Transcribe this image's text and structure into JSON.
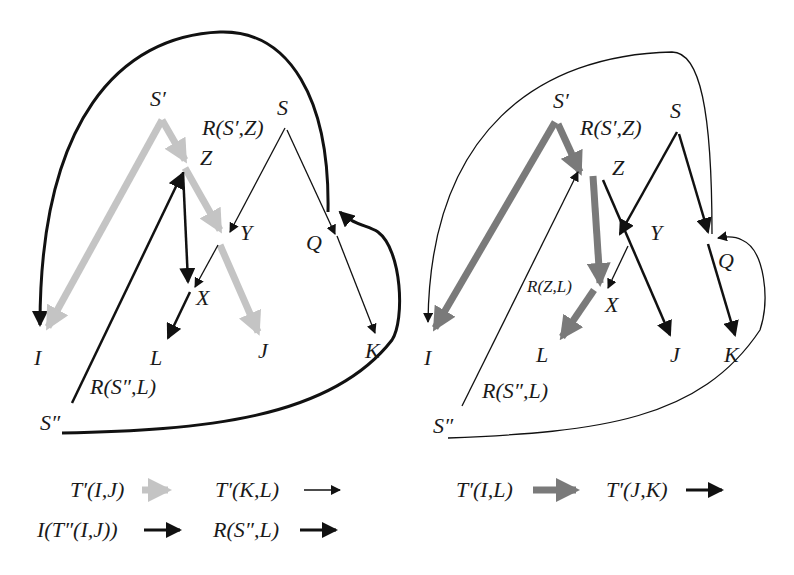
{
  "colors": {
    "light_gray": "#c4c4c4",
    "dark_gray": "#7a7a7a",
    "black": "#111111"
  },
  "left_diagram": {
    "nodes": {
      "S_prime": "S′",
      "S": "S",
      "Z": "Z",
      "Y": "Y",
      "Q": "Q",
      "X": "X",
      "I": "I",
      "L": "L",
      "J": "J",
      "K": "K",
      "S_double": "S″"
    },
    "edge_labels": {
      "R_Sp_Z": "R(S′,Z)",
      "R_Sdd_L": "R(S″,L)"
    },
    "edges": [
      {
        "from": "S'",
        "to": "Z",
        "style": "light-gray-thick"
      },
      {
        "from": "Z",
        "to": "Y",
        "style": "light-gray-thick"
      },
      {
        "from": "Y",
        "to": "J",
        "style": "light-gray-thick"
      },
      {
        "from": "S'",
        "to": "I",
        "style": "light-gray-thick"
      },
      {
        "from": "S",
        "to": "Y",
        "style": "thin-black"
      },
      {
        "from": "S",
        "to": "Q",
        "style": "thin-black"
      },
      {
        "from": "Q",
        "to": "K",
        "style": "thin-black"
      },
      {
        "from": "Y",
        "to": "X",
        "style": "thin-black"
      },
      {
        "from": "Z",
        "to": "X",
        "style": "medium-black"
      },
      {
        "from": "X",
        "to": "L",
        "style": "medium-black"
      },
      {
        "from": "S''",
        "to": "Z",
        "style": "medium-black"
      },
      {
        "from": "Q",
        "to": "I",
        "style": "medium-black-curve"
      },
      {
        "from": "S''",
        "to": "Q",
        "style": "medium-black-curve"
      }
    ]
  },
  "right_diagram": {
    "nodes": {
      "S_prime": "S′",
      "S": "S",
      "Z": "Z",
      "Y": "Y",
      "Q": "Q",
      "X": "X",
      "I": "I",
      "L": "L",
      "J": "J",
      "K": "K",
      "S_double": "S″"
    },
    "edge_labels": {
      "R_Sp_Z": "R(S′,Z)",
      "R_Z_L": "R(Z,L)",
      "R_Sdd_L": "R(S″,L)"
    },
    "edges": [
      {
        "from": "S'",
        "to": "Z",
        "style": "dark-gray-thick"
      },
      {
        "from": "S'",
        "to": "I",
        "style": "dark-gray-thick"
      },
      {
        "from": "Z",
        "to": "X",
        "style": "dark-gray-thick"
      },
      {
        "from": "X",
        "to": "L",
        "style": "dark-gray-thick"
      },
      {
        "from": "S",
        "to": "Y",
        "style": "medium-black"
      },
      {
        "from": "S",
        "to": "Q",
        "style": "medium-black"
      },
      {
        "from": "Z",
        "to": "J",
        "style": "medium-black"
      },
      {
        "from": "Q",
        "to": "K",
        "style": "medium-black"
      },
      {
        "from": "Y",
        "to": "X",
        "style": "thin-black"
      },
      {
        "from": "S''",
        "to": "Z",
        "style": "thin-black"
      },
      {
        "from": "Q",
        "to": "I",
        "style": "thin-black-curve"
      },
      {
        "from": "S''",
        "to": "Q",
        "style": "thin-black-curve"
      }
    ]
  },
  "legend_left": [
    {
      "label": "T′(I,J)",
      "arrow": "light-gray-thick"
    },
    {
      "label": "T′(K,L)",
      "arrow": "thin-black"
    },
    {
      "label": "I(T″(I,J))",
      "arrow": "medium-black"
    },
    {
      "label": "R(S″,L)",
      "arrow": "medium-black"
    }
  ],
  "legend_right": [
    {
      "label": "T′(I,L)",
      "arrow": "dark-gray-thick"
    },
    {
      "label": "T′(J,K)",
      "arrow": "medium-black"
    }
  ]
}
